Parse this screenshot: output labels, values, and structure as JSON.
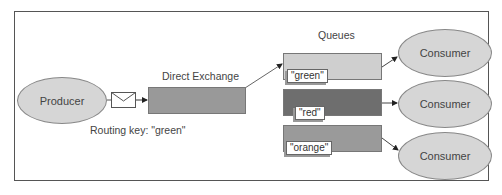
{
  "diagram": {
    "producer": "Producer",
    "exchange_label": "Direct Exchange",
    "routing_key_label": "Routing key: \"green\"",
    "queues_title": "Queues",
    "queues": [
      {
        "tag": "\"green\"",
        "color": "#cfcfcf"
      },
      {
        "tag": "\"red\"",
        "color": "#6e6e6e"
      },
      {
        "tag": "\"orange\"",
        "color": "#9a9a9a"
      }
    ],
    "consumers": [
      "Consumer",
      "Consumer",
      "Consumer"
    ],
    "colors": {
      "exchange": "#999999",
      "ellipse_fill": "#d6d6d6",
      "border": "#555555"
    }
  }
}
